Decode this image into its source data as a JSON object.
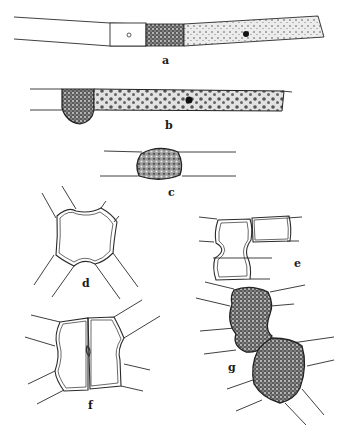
{
  "figure": {
    "panels": [
      {
        "id": "a",
        "label": "a",
        "description": "filament with empty cell, nucleated cell, dense cell and stippled cell with nucleus"
      },
      {
        "id": "b",
        "label": "b",
        "description": "filament with bulging dense cell and spotted cell with nucleus"
      },
      {
        "id": "c",
        "label": "c",
        "description": "single swollen dense cell between two filaments"
      },
      {
        "id": "d",
        "label": "d",
        "description": "empty rounded cell with four radiating walls"
      },
      {
        "id": "e",
        "label": "e",
        "description": "constricted cell beside rectangular cell"
      },
      {
        "id": "f",
        "label": "f",
        "description": "two adjacent cells with shared median wall"
      },
      {
        "id": "g",
        "label": "g",
        "description": "two dense granular constricted cells"
      }
    ]
  }
}
